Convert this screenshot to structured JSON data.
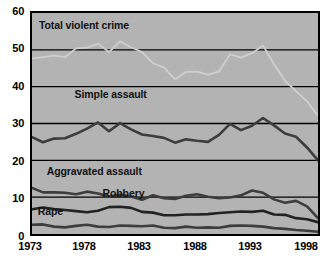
{
  "chart_data": {
    "type": "line",
    "title": "",
    "xlabel": "",
    "ylabel": "",
    "xlim": [
      1973,
      1999
    ],
    "ylim": [
      0,
      60
    ],
    "grid": true,
    "legend_position": "inline-annotations",
    "plot_background": "#b3b3b3",
    "x": [
      1973,
      1974,
      1975,
      1976,
      1977,
      1978,
      1979,
      1980,
      1981,
      1982,
      1983,
      1984,
      1985,
      1986,
      1987,
      1988,
      1989,
      1990,
      1991,
      1992,
      1993,
      1994,
      1995,
      1996,
      1997,
      1998,
      1999
    ],
    "x_tick_labels": [
      "1973",
      "1978",
      "1983",
      "1988",
      "1993",
      "1998"
    ],
    "x_tick_values": [
      1973,
      1978,
      1983,
      1988,
      1993,
      1998
    ],
    "y_tick_labels": [
      "0",
      "10",
      "20",
      "30",
      "40",
      "50",
      "60"
    ],
    "y_tick_values": [
      0,
      10,
      20,
      30,
      40,
      50,
      60
    ],
    "series": [
      {
        "name": "Total violent crime",
        "color": "#cfcfcf",
        "label_color": "#111111",
        "values": [
          47.7,
          48.0,
          48.4,
          48.0,
          50.4,
          50.6,
          51.7,
          49.4,
          52.3,
          50.7,
          49.4,
          46.4,
          45.2,
          42.0,
          44.0,
          44.1,
          43.3,
          44.1,
          48.8,
          47.9,
          49.1,
          51.2,
          46.1,
          41.6,
          38.8,
          36.0,
          32.1
        ]
      },
      {
        "name": "Simple assault",
        "color": "#3d3d3d",
        "label_color": "#111111",
        "values": [
          26.3,
          24.9,
          25.9,
          26.0,
          27.2,
          28.6,
          30.3,
          27.9,
          30.1,
          28.4,
          27.0,
          26.6,
          26.1,
          24.8,
          25.7,
          25.3,
          25.0,
          26.9,
          29.9,
          28.2,
          29.4,
          31.5,
          29.5,
          27.3,
          26.4,
          23.5,
          20.0
        ]
      },
      {
        "name": "Aggravated assault",
        "color": "#3d3d3d",
        "label_color": "#111111",
        "values": [
          12.5,
          11.3,
          11.3,
          11.2,
          10.8,
          11.5,
          11.0,
          10.2,
          10.7,
          10.2,
          9.3,
          10.5,
          9.7,
          9.5,
          10.4,
          10.8,
          10.1,
          9.7,
          9.9,
          10.5,
          11.8,
          11.2,
          9.4,
          8.5,
          9.0,
          7.5,
          4.3
        ]
      },
      {
        "name": "Robbery",
        "color": "#222222",
        "label_color": "#111111",
        "values": [
          6.7,
          7.2,
          6.8,
          6.5,
          6.2,
          5.9,
          6.3,
          7.3,
          7.4,
          7.1,
          6.0,
          5.8,
          5.1,
          5.1,
          5.3,
          5.3,
          5.4,
          5.7,
          5.9,
          6.1,
          6.0,
          6.3,
          5.3,
          5.2,
          4.3,
          4.0,
          3.2
        ]
      },
      {
        "name": "Rape",
        "color": "#3d3d3d",
        "label_color": "#111111",
        "values": [
          2.5,
          2.6,
          2.0,
          1.8,
          2.2,
          2.5,
          2.0,
          1.9,
          2.3,
          2.2,
          2.1,
          2.3,
          1.7,
          1.6,
          2.0,
          1.7,
          1.8,
          1.7,
          2.2,
          2.3,
          2.2,
          2.0,
          1.6,
          1.4,
          1.1,
          0.9,
          0.6
        ]
      }
    ],
    "annotations": [
      {
        "text": "Total violent crime",
        "x": 1973.8,
        "y": 56.0
      },
      {
        "text": "Simple assault",
        "x": 1977.0,
        "y": 37.5
      },
      {
        "text": "Aggravated assault",
        "x": 1974.5,
        "y": 17.0
      },
      {
        "text": "Robbery",
        "x": 1979.5,
        "y": 11.2
      },
      {
        "text": "Rape",
        "x": 1973.7,
        "y": 6.4
      }
    ]
  }
}
